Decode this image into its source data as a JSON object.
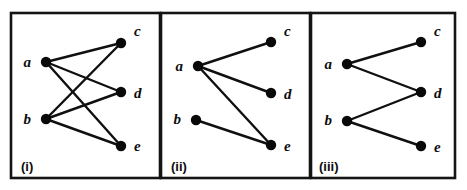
{
  "figure": {
    "background_color": "#ffffff",
    "ink_color": "#101010",
    "border_color": "#141414",
    "width": 467,
    "height": 190
  },
  "chart_data": {
    "type": "diagram",
    "subtype": "bipartite-graph-panels",
    "left_vertices": [
      "a",
      "b"
    ],
    "right_vertices": [
      "c",
      "d",
      "e"
    ],
    "panels": [
      {
        "caption": "(i)",
        "frame": {
          "x": 11,
          "y": 13,
          "width": 149,
          "height": 165
        },
        "nodes": [
          {
            "id": "a",
            "label": "a",
            "x": 46,
            "y": 62,
            "side": "left",
            "label_x": 31,
            "label_y": 67
          },
          {
            "id": "b",
            "label": "b",
            "x": 46,
            "y": 119,
            "side": "left",
            "label_x": 31,
            "label_y": 124
          },
          {
            "id": "c",
            "label": "c",
            "x": 121,
            "y": 43,
            "side": "right",
            "label_x": 134,
            "label_y": 36
          },
          {
            "id": "d",
            "label": "d",
            "x": 121,
            "y": 92,
            "side": "right",
            "label_x": 134,
            "label_y": 98
          },
          {
            "id": "e",
            "label": "e",
            "x": 121,
            "y": 146,
            "side": "right",
            "label_x": 134,
            "label_y": 151
          }
        ],
        "edges": [
          {
            "from": "a",
            "to": "c"
          },
          {
            "from": "a",
            "to": "d"
          },
          {
            "from": "a",
            "to": "e"
          },
          {
            "from": "b",
            "to": "c"
          },
          {
            "from": "b",
            "to": "d"
          },
          {
            "from": "b",
            "to": "e"
          }
        ],
        "edge_count": 6,
        "caption_x": 21,
        "caption_y": 171
      },
      {
        "caption": "(ii)",
        "frame": {
          "x": 161,
          "y": 13,
          "width": 149,
          "height": 165
        },
        "nodes": [
          {
            "id": "a",
            "label": "a",
            "x": 198,
            "y": 66,
            "side": "left",
            "label_x": 183,
            "label_y": 71
          },
          {
            "id": "b",
            "label": "b",
            "x": 196,
            "y": 120,
            "side": "left",
            "label_x": 181,
            "label_y": 124
          },
          {
            "id": "c",
            "label": "c",
            "x": 271,
            "y": 42,
            "side": "right",
            "label_x": 284,
            "label_y": 36
          },
          {
            "id": "d",
            "label": "d",
            "x": 271,
            "y": 93,
            "side": "right",
            "label_x": 284,
            "label_y": 99
          },
          {
            "id": "e",
            "label": "e",
            "x": 271,
            "y": 145,
            "side": "right",
            "label_x": 284,
            "label_y": 151
          }
        ],
        "edges": [
          {
            "from": "a",
            "to": "c"
          },
          {
            "from": "a",
            "to": "d"
          },
          {
            "from": "a",
            "to": "e"
          },
          {
            "from": "b",
            "to": "e"
          }
        ],
        "edge_count": 4,
        "caption_x": 171,
        "caption_y": 171
      },
      {
        "caption": "(iii)",
        "frame": {
          "x": 311,
          "y": 13,
          "width": 144,
          "height": 165
        },
        "nodes": [
          {
            "id": "a",
            "label": "a",
            "x": 347,
            "y": 64,
            "side": "left",
            "label_x": 332,
            "label_y": 69
          },
          {
            "id": "b",
            "label": "b",
            "x": 347,
            "y": 121,
            "side": "left",
            "label_x": 332,
            "label_y": 125
          },
          {
            "id": "c",
            "label": "c",
            "x": 421,
            "y": 42,
            "side": "right",
            "label_x": 434,
            "label_y": 36
          },
          {
            "id": "d",
            "label": "d",
            "x": 421,
            "y": 92,
            "side": "right",
            "label_x": 434,
            "label_y": 98
          },
          {
            "id": "e",
            "label": "e",
            "x": 421,
            "y": 146,
            "side": "right",
            "label_x": 434,
            "label_y": 152
          }
        ],
        "edges": [
          {
            "from": "a",
            "to": "c"
          },
          {
            "from": "a",
            "to": "d"
          },
          {
            "from": "b",
            "to": "d"
          },
          {
            "from": "b",
            "to": "e"
          }
        ],
        "edge_count": 4,
        "caption_x": 319,
        "caption_y": 171
      }
    ]
  }
}
